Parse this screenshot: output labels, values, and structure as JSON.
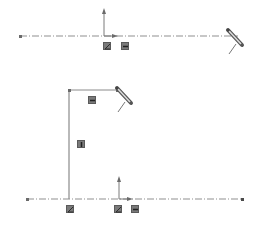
{
  "view": {
    "type": "sketch-canvas",
    "background": "#ffffff",
    "line_color": "#8a8a8a",
    "centerline_color": "#9a9a9a",
    "glyph_color": "#7a7a7a"
  },
  "panels": [
    {
      "id": "top",
      "centerline": {
        "x1": 20,
        "y": 36,
        "x2": 238
      },
      "origin": {
        "x": 104,
        "y": 36
      },
      "relations": [
        {
          "type": "coincident",
          "icon": "coincident-icon",
          "x": 103,
          "y": 42
        },
        {
          "type": "horizontal",
          "icon": "horizontal-icon",
          "x": 121,
          "y": 42
        }
      ],
      "cursor": {
        "icon": "pencil-cursor-icon",
        "x": 228,
        "y": 30
      }
    },
    {
      "id": "bottom",
      "centerline": {
        "x1": 27,
        "y": 199,
        "x2": 243
      },
      "origin": {
        "x": 119,
        "y": 199
      },
      "sketch": {
        "corner": {
          "x": 69,
          "y": 90
        },
        "horizontal_end": {
          "x": 117,
          "y": 90
        },
        "vertical_end": {
          "x": 69,
          "y": 199
        }
      },
      "relations": [
        {
          "type": "horizontal",
          "icon": "horizontal-icon",
          "x": 88,
          "y": 96
        },
        {
          "type": "vertical",
          "icon": "vertical-icon",
          "x": 77,
          "y": 140
        },
        {
          "type": "coincident",
          "icon": "coincident-icon",
          "x": 66,
          "y": 205
        },
        {
          "type": "coincident",
          "icon": "coincident-icon",
          "x": 114,
          "y": 205
        },
        {
          "type": "horizontal",
          "icon": "horizontal-icon",
          "x": 131,
          "y": 205
        }
      ],
      "cursor": {
        "icon": "pencil-cursor-icon",
        "x": 117,
        "y": 88
      }
    }
  ]
}
